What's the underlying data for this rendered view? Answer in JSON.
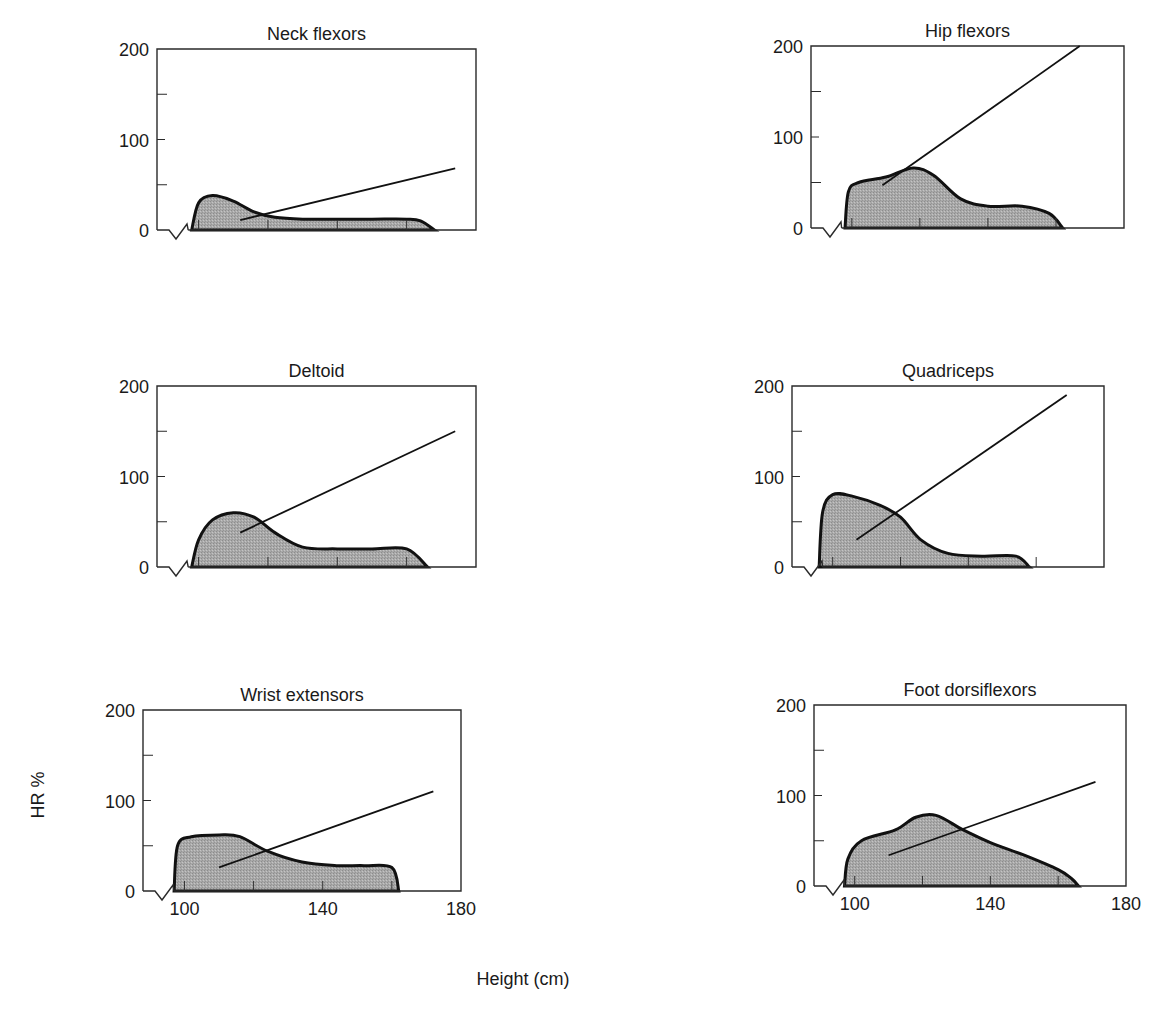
{
  "chart_data": [
    {
      "type": "area",
      "title": "Neck flexors",
      "xlabel": "Height (cm)",
      "ylabel": "HR %",
      "xlim": [
        88,
        180
      ],
      "ylim": [
        0,
        200
      ],
      "yticks": [
        0,
        100,
        200
      ],
      "yminor": [
        50,
        150
      ],
      "xticks_minor": [
        100,
        120,
        140,
        160
      ],
      "grid": false,
      "distribution": {
        "x": [
          98,
          100,
          104,
          110,
          116,
          122,
          130,
          140,
          150,
          160,
          164,
          168
        ],
        "y": [
          0,
          30,
          38,
          32,
          20,
          14,
          12,
          12,
          12,
          12,
          10,
          0
        ]
      },
      "trend_line": {
        "x": [
          112,
          174
        ],
        "y": [
          11,
          68
        ]
      }
    },
    {
      "type": "area",
      "title": "Hip flexors",
      "xlabel": "Height (cm)",
      "ylabel": "HR %",
      "xlim": [
        88,
        180
      ],
      "ylim": [
        0,
        200
      ],
      "yticks": [
        0,
        100,
        200
      ],
      "yminor": [
        50,
        150
      ],
      "xticks_minor": [
        100,
        120,
        140,
        160
      ],
      "grid": false,
      "distribution": {
        "x": [
          98,
          99,
          102,
          110,
          118,
          124,
          132,
          140,
          150,
          158,
          162
        ],
        "y": [
          0,
          40,
          50,
          56,
          66,
          58,
          32,
          24,
          24,
          16,
          0
        ]
      },
      "trend_line": {
        "x": [
          109,
          167
        ],
        "y": [
          47,
          200
        ]
      }
    },
    {
      "type": "area",
      "title": "Deltoid",
      "xlabel": "Height (cm)",
      "ylabel": "HR %",
      "xlim": [
        88,
        180
      ],
      "ylim": [
        0,
        200
      ],
      "yticks": [
        0,
        100,
        200
      ],
      "yminor": [
        50,
        150
      ],
      "xticks_minor": [
        100,
        120,
        140,
        160
      ],
      "grid": false,
      "distribution": {
        "x": [
          98,
          100,
          104,
          110,
          116,
          122,
          130,
          140,
          150,
          160,
          166
        ],
        "y": [
          0,
          30,
          52,
          60,
          55,
          38,
          22,
          20,
          20,
          20,
          0
        ]
      },
      "trend_line": {
        "x": [
          112,
          174
        ],
        "y": [
          38,
          150
        ]
      }
    },
    {
      "type": "area",
      "title": "Quadriceps",
      "xlabel": "Height (cm)",
      "ylabel": "HR %",
      "xlim": [
        88,
        180
      ],
      "ylim": [
        0,
        200
      ],
      "yticks": [
        0,
        100,
        200
      ],
      "yminor": [
        50,
        150
      ],
      "xticks_minor": [
        100,
        120,
        140,
        160
      ],
      "grid": false,
      "distribution": {
        "x": [
          96,
          97,
          100,
          106,
          114,
          120,
          126,
          134,
          144,
          154,
          158
        ],
        "y": [
          0,
          60,
          80,
          78,
          68,
          55,
          30,
          15,
          12,
          12,
          0
        ]
      },
      "trend_line": {
        "x": [
          107,
          169
        ],
        "y": [
          30,
          190
        ]
      }
    },
    {
      "type": "area",
      "title": "Wrist extensors",
      "xlabel": "Height (cm)",
      "ylabel": "HR %",
      "xlim": [
        88,
        180
      ],
      "ylim": [
        0,
        200
      ],
      "yticks": [
        0,
        100,
        200
      ],
      "yminor": [
        50,
        150
      ],
      "xticks": [
        100,
        140,
        180
      ],
      "xticks_minor": [
        100,
        120,
        140,
        160
      ],
      "grid": false,
      "distribution": {
        "x": [
          97,
          98,
          102,
          110,
          116,
          124,
          134,
          144,
          152,
          160,
          162
        ],
        "y": [
          0,
          50,
          60,
          62,
          60,
          44,
          32,
          28,
          28,
          26,
          0
        ]
      },
      "trend_line": {
        "x": [
          110,
          172
        ],
        "y": [
          26,
          110
        ]
      }
    },
    {
      "type": "area",
      "title": "Foot dorsiflexors",
      "xlabel": "Height (cm)",
      "ylabel": "HR %",
      "xlim": [
        88,
        180
      ],
      "ylim": [
        0,
        200
      ],
      "yticks": [
        0,
        100,
        200
      ],
      "yminor": [
        50,
        150
      ],
      "xticks": [
        100,
        140,
        180
      ],
      "xticks_minor": [
        100,
        120,
        140,
        160
      ],
      "grid": false,
      "distribution": {
        "x": [
          97,
          98,
          102,
          112,
          118,
          124,
          132,
          140,
          150,
          160,
          164,
          166
        ],
        "y": [
          0,
          30,
          50,
          62,
          76,
          78,
          62,
          48,
          34,
          18,
          8,
          0
        ]
      },
      "trend_line": {
        "x": [
          110,
          171
        ],
        "y": [
          34,
          115
        ]
      }
    }
  ],
  "figure": {
    "shared_ylabel": "HR %",
    "shared_xlabel": "Height (cm)",
    "ytick_labels": [
      "0",
      "100",
      "200"
    ],
    "xtick_labels": [
      "100",
      "140",
      "180"
    ]
  }
}
